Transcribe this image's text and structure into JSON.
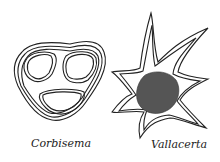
{
  "figure": {
    "organisms": [
      {
        "name": "Corbisema",
        "shape": "triangular-frame"
      },
      {
        "name": "Vallacerta",
        "shape": "spined-star-with-nucleus"
      }
    ]
  },
  "colors": {
    "ink": "#222222",
    "background": "#ffffff"
  }
}
